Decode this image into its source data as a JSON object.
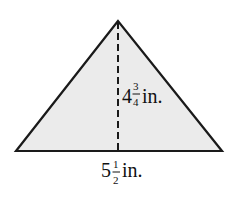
{
  "figure": {
    "shape": "triangle",
    "fill_color": "#ebebeb",
    "stroke_color": "#1a1a1a",
    "height_label": {
      "whole": "4",
      "numerator": "3",
      "denominator": "4",
      "unit": "in."
    },
    "base_label": {
      "whole": "5",
      "numerator": "1",
      "denominator": "2",
      "unit": "in."
    }
  }
}
